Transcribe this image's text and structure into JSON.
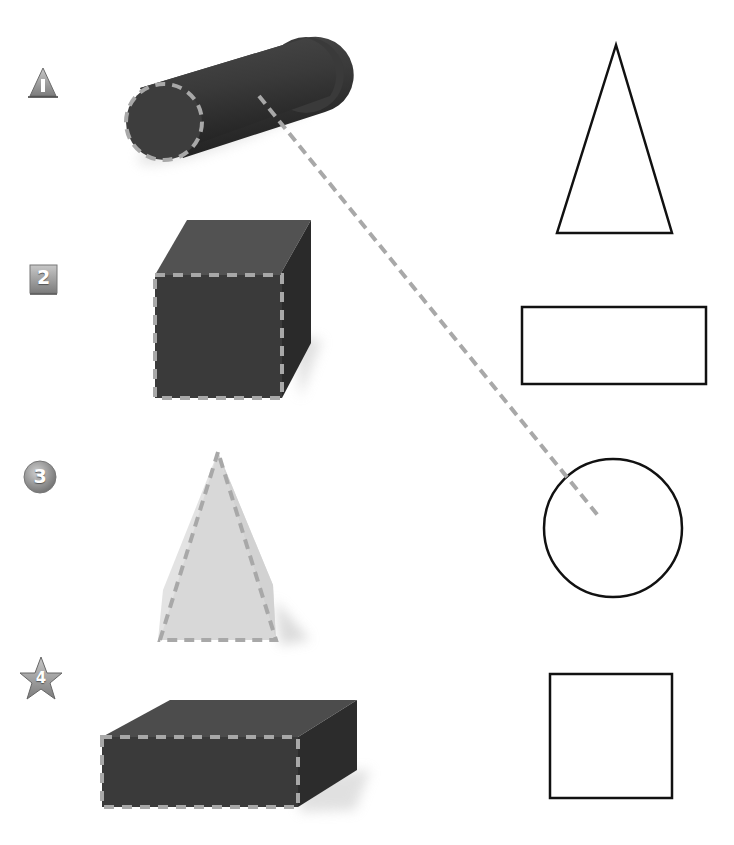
{
  "worksheet": {
    "instructions_hidden": "Match each solid to the shape of its dashed face",
    "items": [
      {
        "number": "1",
        "badge_shape": "triangle",
        "solid": "cylinder",
        "face": "circle"
      },
      {
        "number": "2",
        "badge_shape": "square",
        "solid": "cube",
        "face": "square"
      },
      {
        "number": "3",
        "badge_shape": "circle",
        "solid": "square-pyramid",
        "face": "triangle"
      },
      {
        "number": "4",
        "badge_shape": "star",
        "solid": "rectangular-prism",
        "face": "rectangle"
      }
    ],
    "answer_shapes": [
      "triangle",
      "rectangle",
      "circle",
      "square"
    ],
    "example_match": {
      "from": "cylinder",
      "to": "circle"
    }
  },
  "colors": {
    "solid_dark": "#3c3c3c",
    "solid_top": "#5a5a5a",
    "solid_side": "#2c2c2c",
    "pyramid": "#d9d9d9",
    "dash": "#a8a8a8",
    "badge": "#9a9a9a",
    "outline": "#111111"
  }
}
